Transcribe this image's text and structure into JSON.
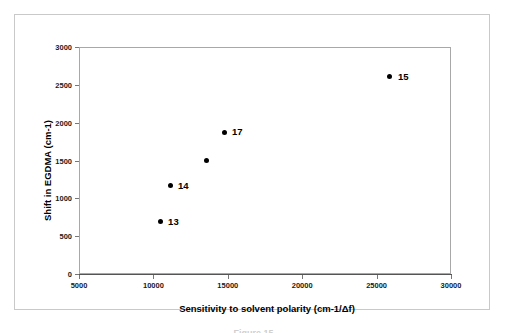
{
  "figure": {
    "caption": "Figure 15"
  },
  "chart_data": {
    "type": "scatter",
    "title": "",
    "xlabel": "Sensitivity to solvent polarity (cm-1/Δf)",
    "ylabel": "Shift in EGDMA (cm-1)",
    "xlim": [
      5000,
      30000
    ],
    "ylim": [
      0,
      3000
    ],
    "xticks": [
      "5000",
      "10000",
      "15000",
      "20000",
      "25000",
      "30000"
    ],
    "xtick_values": [
      5000,
      10000,
      15000,
      20000,
      25000,
      30000
    ],
    "yticks": [
      "0",
      "500",
      "1000",
      "1500",
      "2000",
      "2500",
      "3000"
    ],
    "ytick_values": [
      0,
      500,
      1000,
      1500,
      2000,
      2500,
      3000
    ],
    "grid": false,
    "legend": "none",
    "marker_color": "#000000",
    "points": [
      {
        "label": "13",
        "x": 10450,
        "y": 690
      },
      {
        "label": "14",
        "x": 11120,
        "y": 1165
      },
      {
        "label": "",
        "x": 13600,
        "y": 1495
      },
      {
        "label": "17",
        "x": 14750,
        "y": 1875
      },
      {
        "label": "15",
        "x": 25900,
        "y": 2605
      }
    ]
  }
}
